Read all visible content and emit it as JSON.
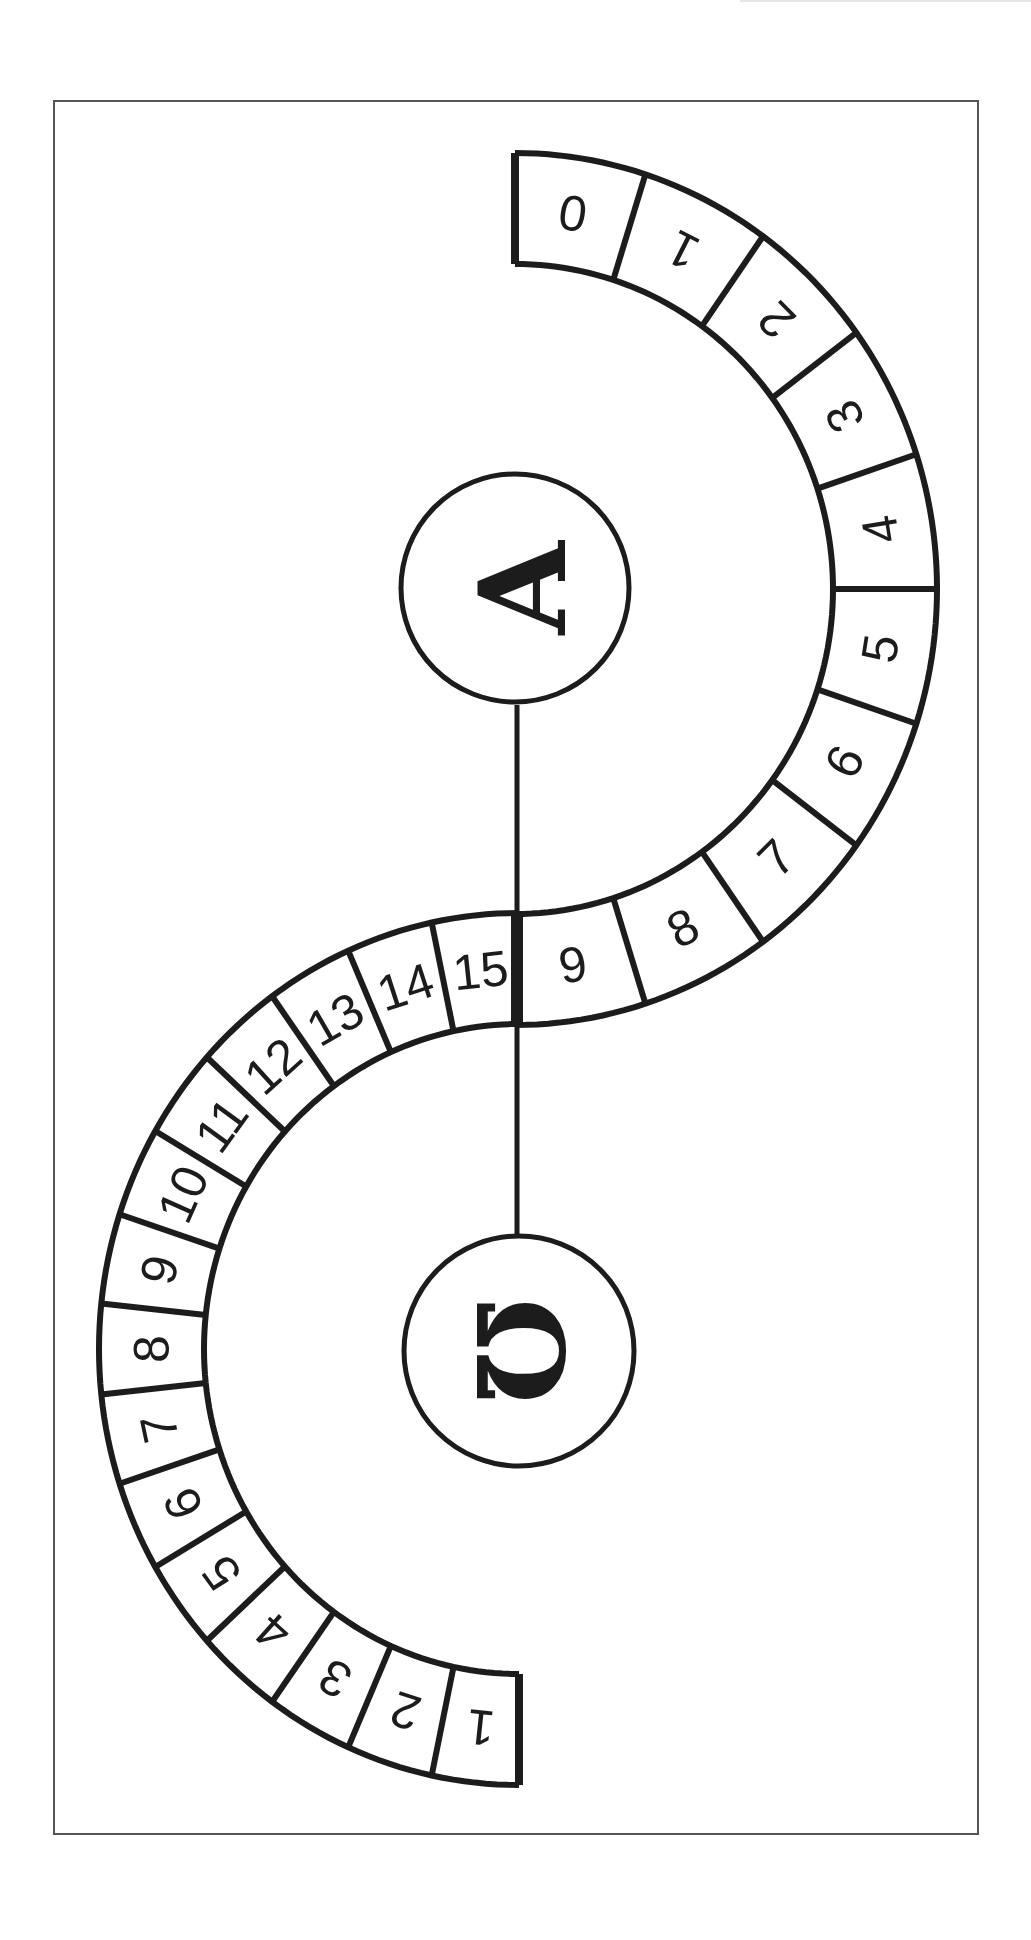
{
  "diagram": {
    "type": "s-shaped counting track",
    "colors": {
      "ink": "#1c1c1c",
      "frame": "#555555",
      "background": "#ffffff"
    },
    "upper_track": {
      "label_symbol": "A",
      "cells": [
        "0",
        "1",
        "2",
        "3",
        "4",
        "5",
        "6",
        "7",
        "8",
        "9"
      ],
      "direction": "from top, clockwise around right side to middle"
    },
    "lower_track": {
      "label_symbol": "Ω",
      "cells": [
        "15",
        "14",
        "13",
        "12",
        "11",
        "10",
        "9",
        "8",
        "7",
        "6",
        "5",
        "4",
        "3",
        "2",
        "1"
      ],
      "direction": "from middle, counter-clockwise around left side to bottom"
    },
    "alpha_node": {
      "symbol": "A"
    },
    "omega_node": {
      "symbol": "Ω"
    },
    "connector": "vertical line joining A and Ω through the track's middle"
  }
}
